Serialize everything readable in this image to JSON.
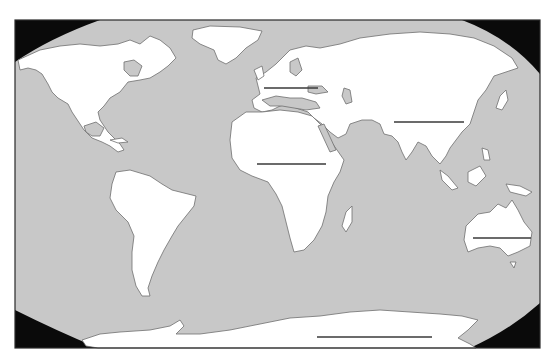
{
  "map": {
    "title": "",
    "type": "blank world map worksheet",
    "colors": {
      "ocean": "#c8c8c8",
      "land": "#ffffff",
      "coastline": "#6e6e6e",
      "outside_projection": "#0a0a0a",
      "label_line": "#3a3a3a"
    },
    "regions": [
      {
        "id": "north-america",
        "name": "North America",
        "has_label_blank": false
      },
      {
        "id": "south-america",
        "name": "South America",
        "has_label_blank": false
      },
      {
        "id": "europe",
        "name": "Europe",
        "has_label_blank": true
      },
      {
        "id": "africa",
        "name": "Africa",
        "has_label_blank": true
      },
      {
        "id": "asia",
        "name": "Asia",
        "has_label_blank": true
      },
      {
        "id": "australia",
        "name": "Australia",
        "has_label_blank": true
      },
      {
        "id": "antarctica",
        "name": "Antarctica",
        "has_label_blank": true
      },
      {
        "id": "greenland",
        "name": "Greenland",
        "has_label_blank": false
      }
    ],
    "label_blanks": [
      {
        "region": "europe",
        "value": ""
      },
      {
        "region": "asia",
        "value": ""
      },
      {
        "region": "africa",
        "value": ""
      },
      {
        "region": "australia",
        "value": ""
      },
      {
        "region": "antarctica",
        "value": ""
      }
    ]
  }
}
